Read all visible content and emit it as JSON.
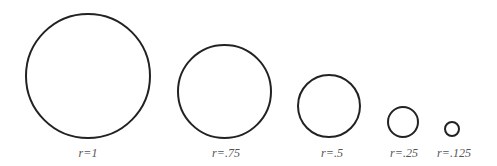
{
  "diagram": {
    "stroke_color": "#222222",
    "label_color": "#555555",
    "circles": [
      {
        "label": "r=1",
        "radius_value": 1,
        "cx": 88,
        "cy": 76,
        "r": 63
      },
      {
        "label": "r=.75",
        "radius_value": 0.75,
        "cx": 224.5,
        "cy": 91.5,
        "r": 47.5
      },
      {
        "label": "r=.5",
        "radius_value": 0.5,
        "cx": 329,
        "cy": 106,
        "r": 32
      },
      {
        "label": "r=.25",
        "radius_value": 0.25,
        "cx": 402.5,
        "cy": 122,
        "r": 16
      },
      {
        "label": "r=.125",
        "radius_value": 0.125,
        "cx": 452,
        "cy": 129,
        "r": 8
      }
    ]
  }
}
